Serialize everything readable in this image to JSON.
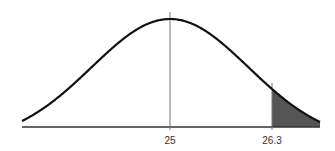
{
  "chart_data": {
    "type": "area",
    "title": "",
    "subtitle": "",
    "xlabel": "",
    "ylabel": "",
    "distribution": "normal",
    "mean": 25,
    "sd": 1,
    "xlim": [
      23.1,
      26.9
    ],
    "tick_labels": [
      "25",
      "26.3"
    ],
    "ticks": [
      25,
      26.3
    ],
    "shaded_region": {
      "from": 26.3,
      "to": 26.9,
      "side": "right-tail"
    },
    "vertical_lines": [
      25,
      26.3
    ],
    "grid": false,
    "legend": null
  },
  "colors": {
    "curve": "#111111",
    "axis": "#333333",
    "vline": "#777777",
    "shade": "#555555",
    "background": "#ffffff"
  },
  "labels": {
    "mean": "25",
    "cutoff": "26.3"
  }
}
